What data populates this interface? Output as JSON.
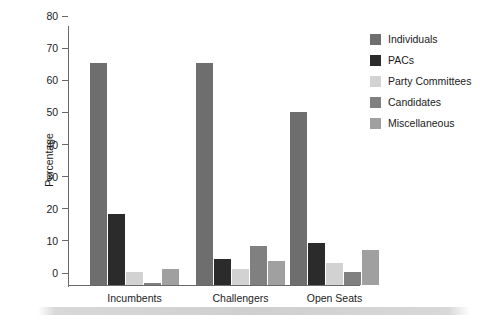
{
  "chart_data": {
    "type": "bar",
    "title": "",
    "xlabel": "",
    "ylabel": "Percentage",
    "ylim": [
      0,
      80
    ],
    "yticks": [
      0,
      10,
      20,
      30,
      40,
      50,
      60,
      70,
      80
    ],
    "grid": false,
    "legend_position": "right",
    "categories": [
      "Incumbents",
      "Challengers",
      "Open Seats"
    ],
    "series": [
      {
        "name": "Individuals",
        "color": "#6e6e6e",
        "values": [
          69,
          69,
          54
        ]
      },
      {
        "name": "PACs",
        "color": "#2b2b2b",
        "values": [
          22,
          8,
          13
        ]
      },
      {
        "name": "Party Committees",
        "color": "#d2d2d2",
        "values": [
          4,
          5,
          7
        ]
      },
      {
        "name": "Candidates",
        "color": "#808080",
        "values": [
          0.5,
          12,
          4
        ]
      },
      {
        "name": "Miscellaneous",
        "color": "#a0a0a0",
        "values": [
          5,
          7.5,
          11
        ]
      }
    ]
  },
  "axis": {
    "y_label": "Percentage",
    "y_tick_labels": [
      "0",
      "10",
      "20",
      "30",
      "40",
      "50",
      "60",
      "70",
      "80"
    ],
    "x_tick_labels": [
      "Incumbents",
      "Challengers",
      "Open Seats"
    ]
  },
  "legend": {
    "items": [
      {
        "label": "Individuals"
      },
      {
        "label": "PACs"
      },
      {
        "label": "Party Committees"
      },
      {
        "label": "Candidates"
      },
      {
        "label": "Miscellaneous"
      }
    ]
  }
}
